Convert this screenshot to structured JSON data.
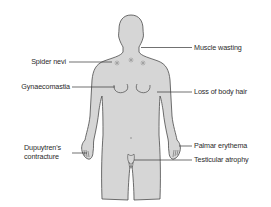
{
  "diagram": {
    "colors": {
      "body_fill": "#d6d6d6",
      "outline": "#4a4a4a",
      "leader_line": "#333333",
      "spider_nevi": "#9a9a9a",
      "text": "#2a2a2a"
    },
    "labels": {
      "muscle_wasting": "Muscle wasting",
      "spider_nevi": "Spider nevi",
      "gynaecomastia": "Gynaecomastia",
      "loss_of_body_hair": "Loss of body hair",
      "dupuytrens_line1": "Dupuytren's",
      "dupuytrens_line2": "contracture",
      "palmar_erythema": "Palmar erythema",
      "testicular_atrophy": "Testicular atrophy"
    }
  }
}
